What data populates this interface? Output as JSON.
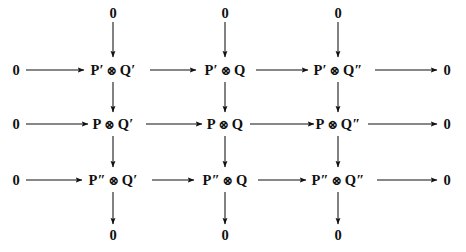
{
  "diagram": {
    "kind": "commutative-diagram",
    "tensor_symbol": "⊗",
    "zero_label": "0",
    "ink_color": "#111111",
    "background_color": "#ffffff",
    "rows": [
      {
        "id": "row-1",
        "left_zero": "0",
        "right_zero": "0",
        "nodes": [
          {
            "id": "node-r1c1",
            "left": "P′",
            "symbol": "⊗",
            "right": "Q′",
            "full": "P′ ⊗ Q′"
          },
          {
            "id": "node-r1c2",
            "left": "P′",
            "symbol": "⊗",
            "right": "Q",
            "full": "P′ ⊗ Q"
          },
          {
            "id": "node-r1c3",
            "left": "P′",
            "symbol": "⊗",
            "right": "Q″",
            "full": "P′ ⊗ Q″"
          }
        ]
      },
      {
        "id": "row-2",
        "left_zero": "0",
        "right_zero": "0",
        "nodes": [
          {
            "id": "node-r2c1",
            "left": "P",
            "symbol": "⊗",
            "right": "Q′",
            "full": "P ⊗ Q′"
          },
          {
            "id": "node-r2c2",
            "left": "P",
            "symbol": "⊗",
            "right": "Q",
            "full": "P ⊗ Q"
          },
          {
            "id": "node-r2c3",
            "left": "P",
            "symbol": "⊗",
            "right": "Q″",
            "full": "P ⊗ Q″"
          }
        ]
      },
      {
        "id": "row-3",
        "left_zero": "0",
        "right_zero": "0",
        "nodes": [
          {
            "id": "node-r3c1",
            "left": "P″",
            "symbol": "⊗",
            "right": "Q′",
            "full": "P″ ⊗ Q′"
          },
          {
            "id": "node-r3c2",
            "left": "P″",
            "symbol": "⊗",
            "right": "Q",
            "full": "P″ ⊗ Q"
          },
          {
            "id": "node-r3c3",
            "left": "P″",
            "symbol": "⊗",
            "right": "Q″",
            "full": "P″ ⊗ Q″"
          }
        ]
      }
    ],
    "top_zeros": [
      "0",
      "0",
      "0"
    ],
    "bottom_zeros": [
      "0",
      "0",
      "0"
    ],
    "layout": {
      "columns_x": [
        113,
        225,
        338
      ],
      "rows_y": [
        70,
        124,
        180
      ],
      "left_zero_x": 16,
      "right_zero_x": 447,
      "top_zero_y": 13,
      "bottom_zero_y": 235
    }
  }
}
